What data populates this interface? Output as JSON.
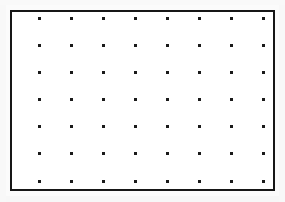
{
  "figure": {
    "kind": "dot-grid",
    "canvas": {
      "width": 285,
      "height": 202,
      "background_color": "#fbfbfb"
    },
    "frame": {
      "name": "grid-frame",
      "left": 10,
      "top": 10,
      "width": 265,
      "height": 181,
      "border_width": 2,
      "border_color": "#161616",
      "fill_color": "#ffffff"
    },
    "grid": {
      "columns": 8,
      "rows": 7,
      "total_dots": 56,
      "dot_size": 3,
      "dot_color": "#1a1a1a",
      "dot_shape": "square",
      "first_dot_x": 38,
      "first_dot_y": 17,
      "spacing_x": 32,
      "spacing_y": 27,
      "column_x": [
        38,
        70,
        102,
        134,
        166,
        198,
        230,
        262
      ],
      "row_y": [
        17,
        44,
        71,
        98,
        125,
        152,
        180
      ]
    }
  }
}
